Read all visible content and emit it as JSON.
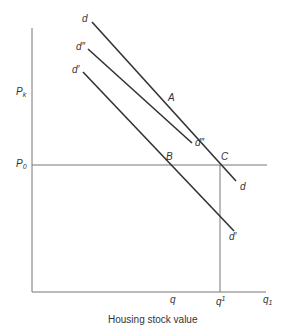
{
  "diagram": {
    "x_axis_label": "Housing stock value",
    "y_axis_labels": {
      "pk": {
        "base": "P",
        "sub": "k"
      },
      "p0": {
        "base": "P",
        "sub": "0"
      }
    },
    "x_ticks": {
      "q": "q",
      "q_prime": {
        "base": "q",
        "sup": "1"
      },
      "q1": {
        "base": "q",
        "sub": "1"
      }
    },
    "points": {
      "A": "A",
      "B": "B",
      "C": "C"
    },
    "curves": {
      "d": {
        "start_label": "d",
        "end_label": "d"
      },
      "d_double_prime": {
        "start_label": "d″",
        "end_label": "d″"
      },
      "d_prime": {
        "start_label": "d′",
        "end_label": "d′"
      }
    },
    "colors": {
      "line": "#333333",
      "axis": "#666666"
    }
  }
}
